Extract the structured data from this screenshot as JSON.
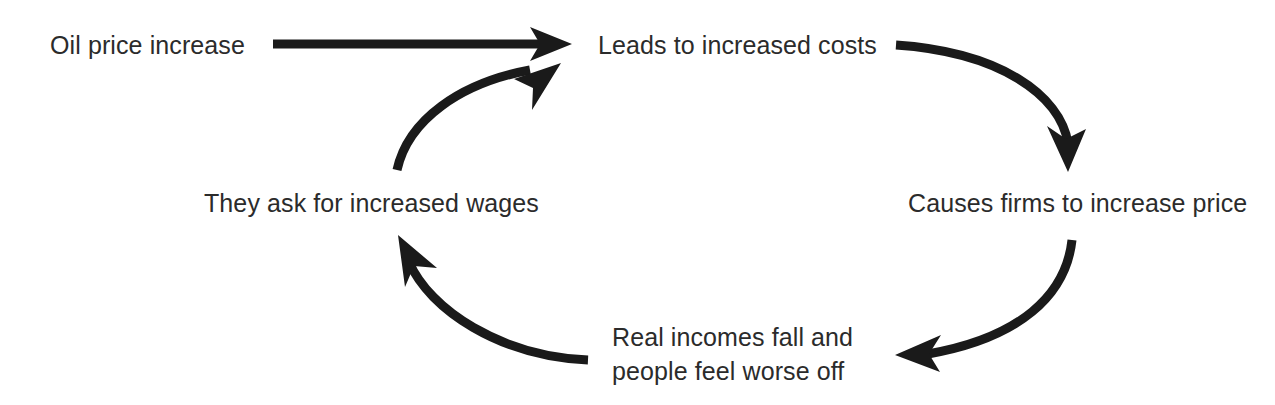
{
  "diagram": {
    "background_color": "#ffffff",
    "text_color": "#2b2b2b",
    "arrow_color": "#1a1a1a",
    "nodes": [
      {
        "id": "oil",
        "label": "Oil price increase",
        "position": "top-left"
      },
      {
        "id": "costs",
        "label": "Leads to increased costs",
        "position": "top-right"
      },
      {
        "id": "firms",
        "label": "Causes firms to increase price",
        "position": "middle-right"
      },
      {
        "id": "incomes",
        "label_line1": "Real incomes fall and",
        "label_line2": "people feel worse off",
        "position": "bottom-center"
      },
      {
        "id": "wages",
        "label": "They ask for increased wages",
        "position": "middle-left"
      }
    ],
    "edges": [
      {
        "id": "oil-to-costs",
        "from": "oil",
        "to": "costs",
        "shape": "straight",
        "direction": "right"
      },
      {
        "id": "costs-to-firms",
        "from": "costs",
        "to": "firms",
        "shape": "arc",
        "direction": "down"
      },
      {
        "id": "firms-to-incomes",
        "from": "firms",
        "to": "incomes",
        "shape": "arc",
        "direction": "left"
      },
      {
        "id": "incomes-to-wages",
        "from": "incomes",
        "to": "wages",
        "shape": "arc",
        "direction": "up-left"
      },
      {
        "id": "wages-to-costs",
        "from": "wages",
        "to": "costs",
        "shape": "arc",
        "direction": "up-right"
      }
    ]
  }
}
